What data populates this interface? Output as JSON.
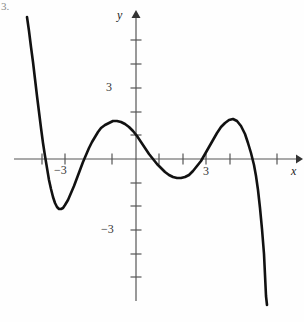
{
  "figure": {
    "tag": "3.",
    "background_color": "#fefefe",
    "curve_color": "#111111",
    "axis_color": "#555555"
  },
  "axes": {
    "x_label": "x",
    "y_label": "y",
    "origin_px": [
      136,
      159
    ],
    "x_unit_px": 47,
    "y_unit_px": 23.7
  },
  "labels": {
    "x_neg3": "−3",
    "x_pos3": "3",
    "y_pos3": "3",
    "y_neg3": "−3"
  },
  "chart_data": {
    "type": "line",
    "title": "",
    "xlabel": "x",
    "ylabel": "y",
    "xlim": [
      -2.5,
      3.6
    ],
    "ylim": [
      -6.2,
      6.2
    ],
    "grid": false,
    "legend": false,
    "x_ticks": [
      -3,
      -2,
      -1,
      1,
      2,
      3
    ],
    "x_tick_labels": [
      "−3",
      "",
      "",
      "",
      "",
      "3"
    ],
    "y_ticks": [
      -5,
      -4,
      -3,
      -2,
      -1,
      1,
      2,
      3,
      4,
      5
    ],
    "y_tick_labels": [
      "",
      "",
      "−3",
      "",
      "",
      "",
      "",
      "3",
      "",
      ""
    ],
    "roots_x": [
      -2.02,
      -1.02,
      0.4,
      1.45,
      2.51
    ],
    "turning_points": [
      {
        "type": "local-min",
        "x": -1.64,
        "y": -2.11
      },
      {
        "type": "local-max",
        "x": -0.34,
        "y": 1.56
      },
      {
        "type": "local-min",
        "x": 0.94,
        "y": -0.8
      },
      {
        "type": "local-max",
        "x": 2.06,
        "y": 1.65
      }
    ],
    "y_intercept": 1.33,
    "series": [
      {
        "name": "polynomial",
        "points_px": [
          [
            27,
            17
          ],
          [
            29,
            31
          ],
          [
            31,
            47
          ],
          [
            33,
            62
          ],
          [
            35,
            79
          ],
          [
            37,
            96
          ],
          [
            39,
            112
          ],
          [
            41,
            128
          ],
          [
            43,
            143
          ],
          [
            45,
            156
          ],
          [
            47,
            168
          ],
          [
            49,
            180
          ],
          [
            51,
            189
          ],
          [
            53,
            197
          ],
          [
            55,
            203
          ],
          [
            57,
            207
          ],
          [
            59,
            209
          ],
          [
            61,
            209
          ],
          [
            63,
            208
          ],
          [
            65,
            205
          ],
          [
            68,
            200
          ],
          [
            71,
            193
          ],
          [
            74,
            186
          ],
          [
            77,
            178
          ],
          [
            80,
            170
          ],
          [
            83,
            162
          ],
          [
            86,
            155
          ],
          [
            89,
            148
          ],
          [
            92,
            142
          ],
          [
            95,
            137
          ],
          [
            98,
            132
          ],
          [
            101,
            128
          ],
          [
            105,
            125
          ],
          [
            109,
            123
          ],
          [
            113,
            121
          ],
          [
            117,
            121
          ],
          [
            121,
            122
          ],
          [
            125,
            124
          ],
          [
            129,
            127
          ],
          [
            133,
            131
          ],
          [
            137,
            136
          ],
          [
            141,
            142
          ],
          [
            145,
            148
          ],
          [
            149,
            154
          ],
          [
            153,
            159
          ],
          [
            157,
            164
          ],
          [
            161,
            168
          ],
          [
            165,
            172
          ],
          [
            169,
            175
          ],
          [
            173,
            177
          ],
          [
            177,
            178
          ],
          [
            181,
            178
          ],
          [
            185,
            177
          ],
          [
            189,
            175
          ],
          [
            193,
            171
          ],
          [
            197,
            166
          ],
          [
            201,
            161
          ],
          [
            205,
            154
          ],
          [
            209,
            147
          ],
          [
            213,
            140
          ],
          [
            217,
            133
          ],
          [
            221,
            127
          ],
          [
            225,
            123
          ],
          [
            229,
            120
          ],
          [
            233,
            119
          ],
          [
            237,
            121
          ],
          [
            241,
            126
          ],
          [
            245,
            134
          ],
          [
            248,
            143
          ],
          [
            251,
            153
          ],
          [
            254,
            165
          ],
          [
            256,
            176
          ],
          [
            258,
            190
          ],
          [
            260,
            208
          ],
          [
            262,
            229
          ],
          [
            264,
            254
          ],
          [
            265,
            275
          ],
          [
            266,
            296
          ],
          [
            267,
            305
          ]
        ]
      }
    ]
  }
}
